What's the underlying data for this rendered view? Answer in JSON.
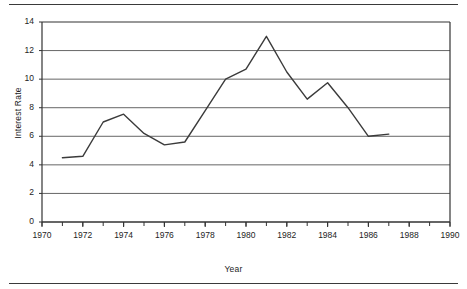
{
  "figure": {
    "has_top_rule": true,
    "has_bottom_rule": true,
    "line_color": "#3b3b3b",
    "grid_color": "#555555",
    "axis_color": "#333333",
    "background": "#ffffff"
  },
  "chart_data": {
    "type": "line",
    "title": "",
    "xlabel": "Year",
    "ylabel": "Interest Rate",
    "xlim": [
      1970,
      1990
    ],
    "ylim": [
      0,
      14
    ],
    "ytick_values": [
      0,
      2,
      4,
      6,
      8,
      10,
      12,
      14
    ],
    "ytick_labels": [
      "0",
      "2",
      "4",
      "6",
      "8",
      "10",
      "12",
      "14"
    ],
    "xtick_values": [
      1970,
      1972,
      1974,
      1976,
      1978,
      1980,
      1982,
      1984,
      1986,
      1988,
      1990
    ],
    "xtick_labels": [
      "1970",
      "1972",
      "1974",
      "1976",
      "1978",
      "1980",
      "1982",
      "1984",
      "1986",
      "1988",
      "1990"
    ],
    "x_minor_tick_step": 1,
    "grid": "horizontal",
    "legend": "none",
    "series": [
      {
        "name": "Interest Rate",
        "x": [
          1971,
          1972,
          1973,
          1974,
          1975,
          1976,
          1977,
          1978,
          1979,
          1980,
          1981,
          1982,
          1983,
          1984,
          1985,
          1986,
          1987
        ],
        "values": [
          4.5,
          4.6,
          7.0,
          7.55,
          6.2,
          5.4,
          5.6,
          7.8,
          10.0,
          10.7,
          13.0,
          10.5,
          8.6,
          9.75,
          8.0,
          6.0,
          6.15
        ]
      }
    ]
  }
}
